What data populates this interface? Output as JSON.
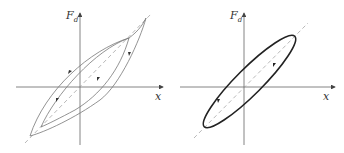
{
  "figure": {
    "colors": {
      "axis": "#666666",
      "curve_thin": "#777777",
      "curve_bold": "#222222",
      "dashed": "#999999"
    },
    "left": {
      "title": "hysteresis loops (nested)",
      "y_label": "F",
      "y_label_sub": "d",
      "x_label": "x",
      "loops": [
        "outer loop",
        "inner loop"
      ],
      "arrows": 4
    },
    "right": {
      "title": "elliptical loop",
      "y_label": "F",
      "y_label_sub": "d",
      "x_label": "x",
      "loops": [
        "ellipse"
      ],
      "arrows": 2
    }
  }
}
